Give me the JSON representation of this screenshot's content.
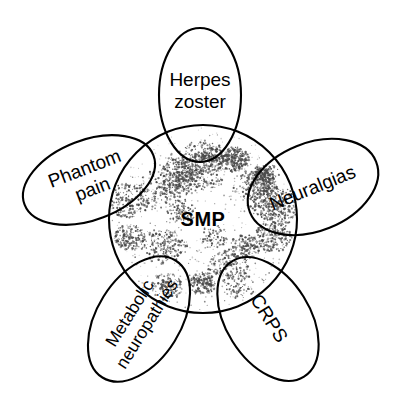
{
  "figure": {
    "background_color": "#ffffff",
    "stroke_color": "#000000",
    "stipple_color": "#4a4a4a",
    "center": {
      "label": "SMP",
      "shape": "circle",
      "cx": 203,
      "cy": 219,
      "r": 94,
      "fill_pattern": "stipple"
    },
    "lobes": [
      {
        "id": "herpes-zoster",
        "label_line1": "Herpes",
        "label_line2": "zoster",
        "shape": "ellipse",
        "cx": 200,
        "cy": 95,
        "rx": 41,
        "ry": 67,
        "rotation": 0,
        "label_rotation": 0,
        "label_cx": 200,
        "label_cy": 92
      },
      {
        "id": "phantom-pain",
        "label_line1": "Phantom",
        "label_line2": "pain",
        "shape": "ellipse",
        "cx": 89,
        "cy": 180,
        "rx": 69,
        "ry": 40,
        "rotation": -21,
        "label_rotation": -21,
        "label_cx": 89,
        "label_cy": 180
      },
      {
        "id": "neuralgias",
        "label_line1": "Neuralgias",
        "label_line2": "",
        "shape": "ellipse",
        "cx": 313,
        "cy": 187,
        "rx": 68,
        "ry": 44,
        "rotation": -22,
        "label_rotation": -22,
        "label_cx": 313,
        "label_cy": 189
      },
      {
        "id": "metabolic-neuropathies",
        "label_line1": "Metabolic",
        "label_line2": "neuropathies",
        "shape": "ellipse",
        "cx": 139,
        "cy": 319,
        "rx": 69,
        "ry": 42,
        "rotation": -58,
        "label_rotation": -58,
        "label_cx": 139,
        "label_cy": 319
      },
      {
        "id": "crps",
        "label_line1": "CRPS",
        "label_line2": "",
        "shape": "ellipse",
        "cx": 268,
        "cy": 319,
        "rx": 68,
        "ry": 42,
        "rotation": 58,
        "label_rotation": 58,
        "label_cx": 268,
        "label_cy": 319
      }
    ]
  }
}
